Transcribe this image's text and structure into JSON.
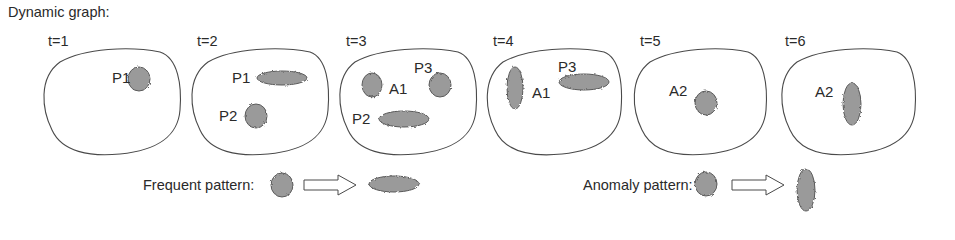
{
  "title": "Dynamic graph:",
  "colors": {
    "outline": "#4a4a4a",
    "blob_fill": "#9a9a9a",
    "blob_stroke": "#5a5a5a",
    "text": "#2a2a2a",
    "background": "#ffffff"
  },
  "panels": [
    {
      "time_label": "t=1",
      "nodes": [
        {
          "label": "P1",
          "shape": "round"
        }
      ]
    },
    {
      "time_label": "t=2",
      "nodes": [
        {
          "label": "P1",
          "shape": "flat"
        },
        {
          "label": "P2",
          "shape": "round"
        }
      ]
    },
    {
      "time_label": "t=3",
      "nodes": [
        {
          "label": "A1",
          "shape": "round"
        },
        {
          "label": "P3",
          "shape": "round"
        },
        {
          "label": "P2",
          "shape": "flat"
        }
      ]
    },
    {
      "time_label": "t=4",
      "nodes": [
        {
          "label": "A1",
          "shape": "tall"
        },
        {
          "label": "P3",
          "shape": "flat"
        }
      ]
    },
    {
      "time_label": "t=5",
      "nodes": [
        {
          "label": "A2",
          "shape": "round"
        }
      ]
    },
    {
      "time_label": "t=6",
      "nodes": [
        {
          "label": "A2",
          "shape": "tall"
        }
      ]
    }
  ],
  "legend": {
    "frequent": {
      "label": "Frequent pattern:",
      "from_shape": "round",
      "arrow": "hollow-right-arrow",
      "to_shape": "flat"
    },
    "anomaly": {
      "label": "Anomaly pattern:",
      "from_shape": "round",
      "arrow": "hollow-right-arrow",
      "to_shape": "tall"
    }
  }
}
